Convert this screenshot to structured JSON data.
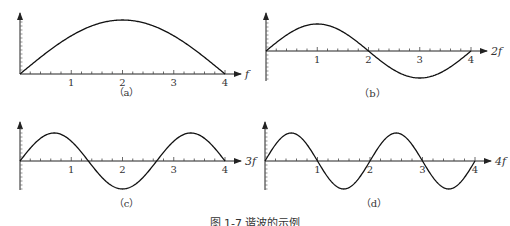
{
  "figure": {
    "caption": "图 1-7 谐波的示例",
    "panels": [
      {
        "id": "a",
        "label": "（a）",
        "x_axis_label": "f",
        "ticks": [
          "1",
          "2",
          "3",
          "4"
        ],
        "cycles_half": 1
      },
      {
        "id": "b",
        "label": "（b）",
        "x_axis_label": "2f",
        "ticks": [
          "1",
          "2",
          "3",
          "4"
        ],
        "cycles_half": 2
      },
      {
        "id": "c",
        "label": "（c）",
        "x_axis_label": "3f",
        "ticks": [
          "1",
          "2",
          "3",
          "4"
        ],
        "cycles_half": 3
      },
      {
        "id": "d",
        "label": "（d）",
        "x_axis_label": "4f",
        "ticks": [
          "1",
          "2",
          "3",
          "4"
        ],
        "cycles_half": 4
      }
    ]
  },
  "chart_data": [
    {
      "type": "line",
      "title": "(a)",
      "xlabel": "f",
      "x": [
        0,
        1,
        2,
        3,
        4
      ],
      "function": "sin(pi*x/4)",
      "ylim": [
        -1,
        1
      ],
      "description": "half sine wave from 0 to 4, peak at x=2"
    },
    {
      "type": "line",
      "title": "(b)",
      "xlabel": "2f",
      "x": [
        0,
        1,
        2,
        3,
        4
      ],
      "function": "sin(2*pi*x/4)",
      "ylim": [
        -1,
        1
      ],
      "description": "one full sine period, peak at 1, zero at 2, trough at 3"
    },
    {
      "type": "line",
      "title": "(c)",
      "xlabel": "3f",
      "x": [
        0,
        1,
        2,
        3,
        4
      ],
      "function": "sin(3*pi*x/4)",
      "ylim": [
        -1,
        1
      ],
      "description": "1.5 sine periods, zeros at 4/3 and 8/3"
    },
    {
      "type": "line",
      "title": "(d)",
      "xlabel": "4f",
      "x": [
        0,
        1,
        2,
        3,
        4
      ],
      "function": "sin(4*pi*x/4)",
      "ylim": [
        -1,
        1
      ],
      "description": "two full sine periods, zeros at 1, 2, 3"
    }
  ]
}
